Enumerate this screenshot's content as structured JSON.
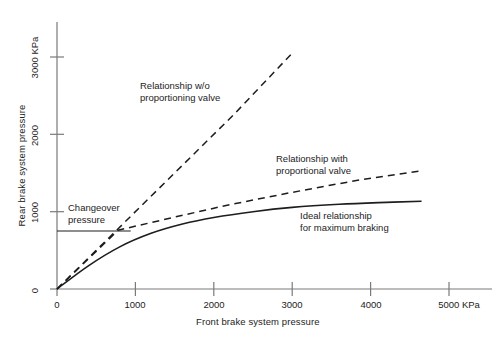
{
  "chart_data": {
    "type": "line",
    "title": "",
    "xlabel": "Front brake system pressure",
    "ylabel": "Rear brake system pressure",
    "xlim": [
      0,
      5300
    ],
    "ylim": [
      0,
      3300
    ],
    "xticks": [
      0,
      1000,
      2000,
      3000,
      4000,
      5000
    ],
    "xticklabels": [
      "0",
      "1000",
      "2000",
      "3000",
      "4000",
      "5000 KPa"
    ],
    "yticks": [
      0,
      1000,
      2000,
      3000
    ],
    "yticklabels": [
      "0",
      "1000",
      "2000",
      "3000 KPa"
    ],
    "grid": false,
    "legend_position": "inline-annotations",
    "units": "KPa",
    "series": [
      {
        "name": "Relationship w/o proportioning valve",
        "style": "dashed",
        "x": [
          0,
          780,
          1500,
          2250,
          3000
        ],
        "y": [
          0,
          780,
          1500,
          2250,
          3050
        ]
      },
      {
        "name": "Relationship with proportional valve",
        "style": "dashed",
        "x": [
          0,
          780,
          1500,
          2200,
          3000,
          3800,
          4650
        ],
        "y": [
          0,
          760,
          930,
          1090,
          1250,
          1400,
          1530
        ]
      },
      {
        "name": "Ideal relationship for maximum braking",
        "style": "solid",
        "x": [
          0,
          400,
          800,
          1200,
          1600,
          2000,
          2500,
          3000,
          3600,
          4200,
          4650
        ],
        "y": [
          0,
          300,
          545,
          720,
          840,
          925,
          1000,
          1055,
          1095,
          1120,
          1135
        ]
      }
    ],
    "annotations": [
      {
        "name": "changeover-pressure",
        "text": "Changeover\npressure",
        "value": 750,
        "leader_from_x": 0,
        "leader_to_x": 940,
        "leader_y": 750
      }
    ]
  },
  "labels": {
    "no_valve": "Relationship w/o\nproportioning valve",
    "with_valve": "Relationship with\nproportional valve",
    "ideal": "Ideal relationship\nfor maximum braking",
    "changeover": "Changeover\npressure"
  },
  "axes": {
    "x_title": "Front brake system pressure",
    "y_title": "Rear brake system pressure",
    "x_tick_0": "0",
    "x_tick_1000": "1000",
    "x_tick_2000": "2000",
    "x_tick_3000": "3000",
    "x_tick_4000": "4000",
    "x_tick_5000": "5000 KPa",
    "y_tick_0": "0",
    "y_tick_1000": "1000",
    "y_tick_2000": "2000",
    "y_tick_3000": "3000 KPa"
  },
  "colors": {
    "axis": "#6e6e6e",
    "curve": "#1d1d1d",
    "text": "#1d1d1d",
    "background": "#ffffff"
  }
}
